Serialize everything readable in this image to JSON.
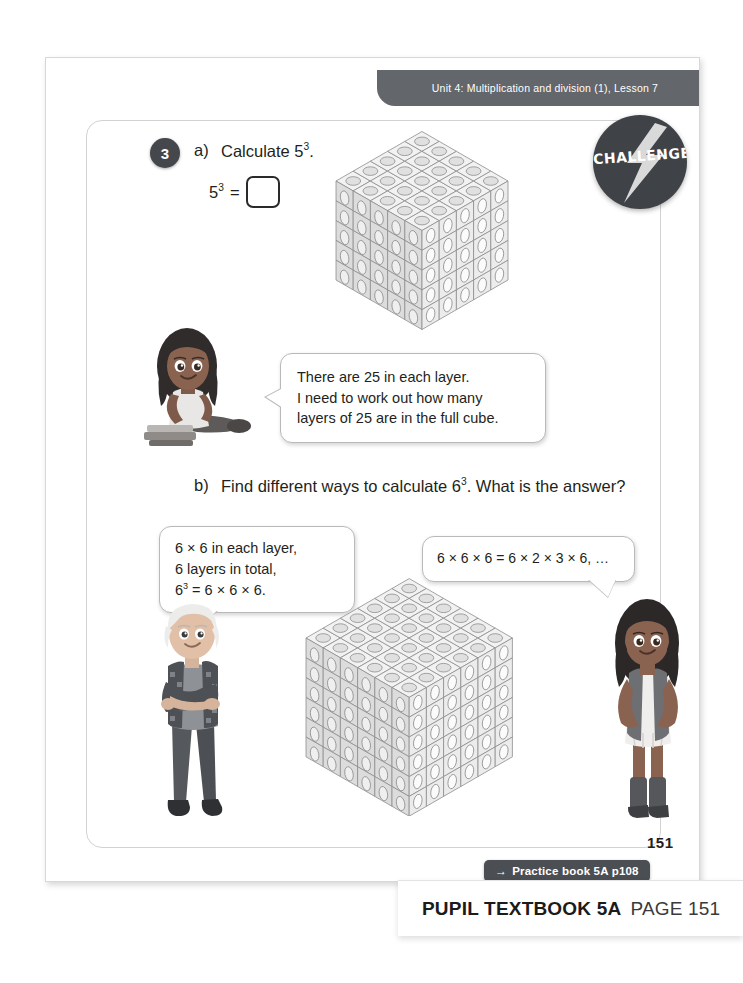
{
  "page": {
    "unit_header": "Unit 4: Multiplication and division (1), Lesson 7",
    "page_number": "151",
    "practice_link": "Practice book 5A p108",
    "practice_link_arrow": "→"
  },
  "badge": {
    "label": "CHALLENGE",
    "icon": "lightning-bolt-icon",
    "color": "#3f4246"
  },
  "question": {
    "number": "3",
    "part_a": {
      "marker": "a)",
      "prompt_prefix": "Calculate 5",
      "prompt_exponent": "3",
      "prompt_suffix": ".",
      "equation_base": "5",
      "equation_exponent": "3",
      "equation_equals": "=",
      "answer_value": ""
    },
    "part_b": {
      "marker": "b)",
      "prompt_prefix": "Find different ways to calculate 6",
      "prompt_exponent": "3",
      "prompt_suffix": ". What is the answer?"
    }
  },
  "bubbles": {
    "girl_seated": {
      "line1": "There are 25 in each layer.",
      "line2": "I need to work out how many",
      "line3": "layers of 25 are in the full cube."
    },
    "boy": {
      "line1": "6 × 6 in each layer,",
      "line2": "6 layers in total,",
      "line3_base": "6",
      "line3_exp": "3",
      "line3_rest": " = 6 × 6 × 6."
    },
    "girl_standing": {
      "line1": "6 × 6 × 6 = 6 × 2 × 3 × 6, …"
    }
  },
  "cubes": [
    {
      "name": "cube-5x5x5",
      "size": 5,
      "total": 125
    },
    {
      "name": "cube-6x6x6",
      "size": 6,
      "total": 216
    }
  ],
  "characters": [
    {
      "name": "girl-seated-with-books",
      "pose": "seated"
    },
    {
      "name": "boy-standing-arms-crossed",
      "pose": "standing"
    },
    {
      "name": "girl-standing-hands-on-hips",
      "pose": "standing"
    }
  ],
  "caption": {
    "strong": "PUPIL TEXTBOOK 5A",
    "light": "PAGE 151"
  }
}
